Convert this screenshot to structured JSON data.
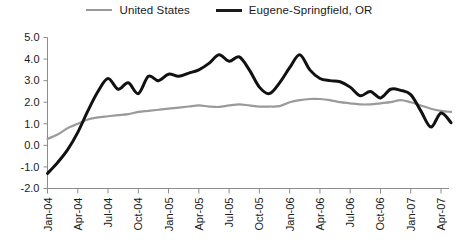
{
  "legend": {
    "position": "top-center",
    "items": [
      {
        "label": "United States",
        "color": "#9a9a9a",
        "key": "united_states"
      },
      {
        "label": "Eugene-Springfield, OR",
        "color": "#111111",
        "key": "eugene_springfield"
      }
    ]
  },
  "axes": {
    "y_ticks": [
      "5.0",
      "4.0",
      "3.0",
      "2.0",
      "1.0",
      "0.0",
      "-1.0",
      "-2.0"
    ],
    "x_ticks": [
      "Jan-04",
      "Apr-04",
      "Jul-04",
      "Oct-04",
      "Jan-05",
      "Apr-05",
      "Jul-05",
      "Oct-05",
      "Jan-06",
      "Apr-06",
      "Jul-06",
      "Oct-06",
      "Jan-07",
      "Apr-07"
    ]
  },
  "chart_data": {
    "type": "line",
    "title": "",
    "subtitle": "",
    "xlabel": "",
    "ylabel": "",
    "ylim": [
      -2.0,
      5.0
    ],
    "ytick_step": 1.0,
    "grid": false,
    "legend_position": "top-center",
    "x_tick_labels": [
      "Jan-04",
      "Apr-04",
      "Jul-04",
      "Oct-04",
      "Jan-05",
      "Apr-05",
      "Jul-05",
      "Oct-05",
      "Jan-06",
      "Apr-06",
      "Jul-06",
      "Oct-06",
      "Jan-07",
      "Apr-07"
    ],
    "x": [
      "Jan-04",
      "Feb-04",
      "Mar-04",
      "Apr-04",
      "May-04",
      "Jun-04",
      "Jul-04",
      "Aug-04",
      "Sep-04",
      "Oct-04",
      "Nov-04",
      "Dec-04",
      "Jan-05",
      "Feb-05",
      "Mar-05",
      "Apr-05",
      "May-05",
      "Jun-05",
      "Jul-05",
      "Aug-05",
      "Sep-05",
      "Oct-05",
      "Nov-05",
      "Dec-05",
      "Jan-06",
      "Feb-06",
      "Mar-06",
      "Apr-06",
      "May-06",
      "Jun-06",
      "Jul-06",
      "Aug-06",
      "Sep-06",
      "Oct-06",
      "Nov-06",
      "Dec-06",
      "Jan-07",
      "Feb-07",
      "Mar-07",
      "Apr-07",
      "May-07"
    ],
    "series": [
      {
        "name": "United States",
        "color": "#9a9a9a",
        "values": [
          0.3,
          0.5,
          0.8,
          1.0,
          1.2,
          1.3,
          1.35,
          1.4,
          1.45,
          1.55,
          1.6,
          1.65,
          1.7,
          1.75,
          1.8,
          1.85,
          1.8,
          1.78,
          1.85,
          1.9,
          1.85,
          1.8,
          1.8,
          1.82,
          2.0,
          2.1,
          2.15,
          2.15,
          2.1,
          2.0,
          1.95,
          1.9,
          1.9,
          1.95,
          2.0,
          2.1,
          2.0,
          1.85,
          1.7,
          1.6,
          1.55
        ]
      },
      {
        "name": "Eugene-Springfield, OR",
        "color": "#111111",
        "values": [
          -1.3,
          -0.8,
          -0.2,
          0.6,
          1.6,
          2.5,
          3.1,
          2.6,
          2.9,
          2.4,
          3.2,
          3.0,
          3.3,
          3.2,
          3.35,
          3.5,
          3.8,
          4.2,
          3.9,
          4.1,
          3.5,
          2.7,
          2.4,
          2.9,
          3.6,
          4.2,
          3.5,
          3.1,
          3.0,
          2.95,
          2.7,
          2.3,
          2.5,
          2.2,
          2.6,
          2.55,
          2.35,
          1.6,
          0.85,
          1.5,
          1.05
        ]
      }
    ]
  }
}
